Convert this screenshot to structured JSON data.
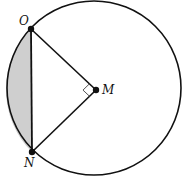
{
  "diagram": {
    "type": "circle-geometry",
    "width": 187,
    "height": 177,
    "colors": {
      "stroke": "#111111",
      "shaded_segment": "#cfcfcf",
      "right_angle_marker": "#555555",
      "background": "#ffffff"
    },
    "circle": {
      "cx": 94,
      "cy": 88,
      "r": 87
    },
    "points": {
      "O": {
        "label": "O",
        "x": 31,
        "y": 29
      },
      "N": {
        "label": "N",
        "x": 32,
        "y": 152
      },
      "M": {
        "label": "M",
        "x": 96,
        "y": 90
      }
    },
    "segments": [
      {
        "from": "O",
        "to": "N",
        "kind": "chord"
      },
      {
        "from": "O",
        "to": "M",
        "kind": "radius"
      },
      {
        "from": "N",
        "to": "M",
        "kind": "radius"
      }
    ],
    "right_angle_at": "M",
    "shaded_region": "minor segment between chord ON and arc ON"
  }
}
